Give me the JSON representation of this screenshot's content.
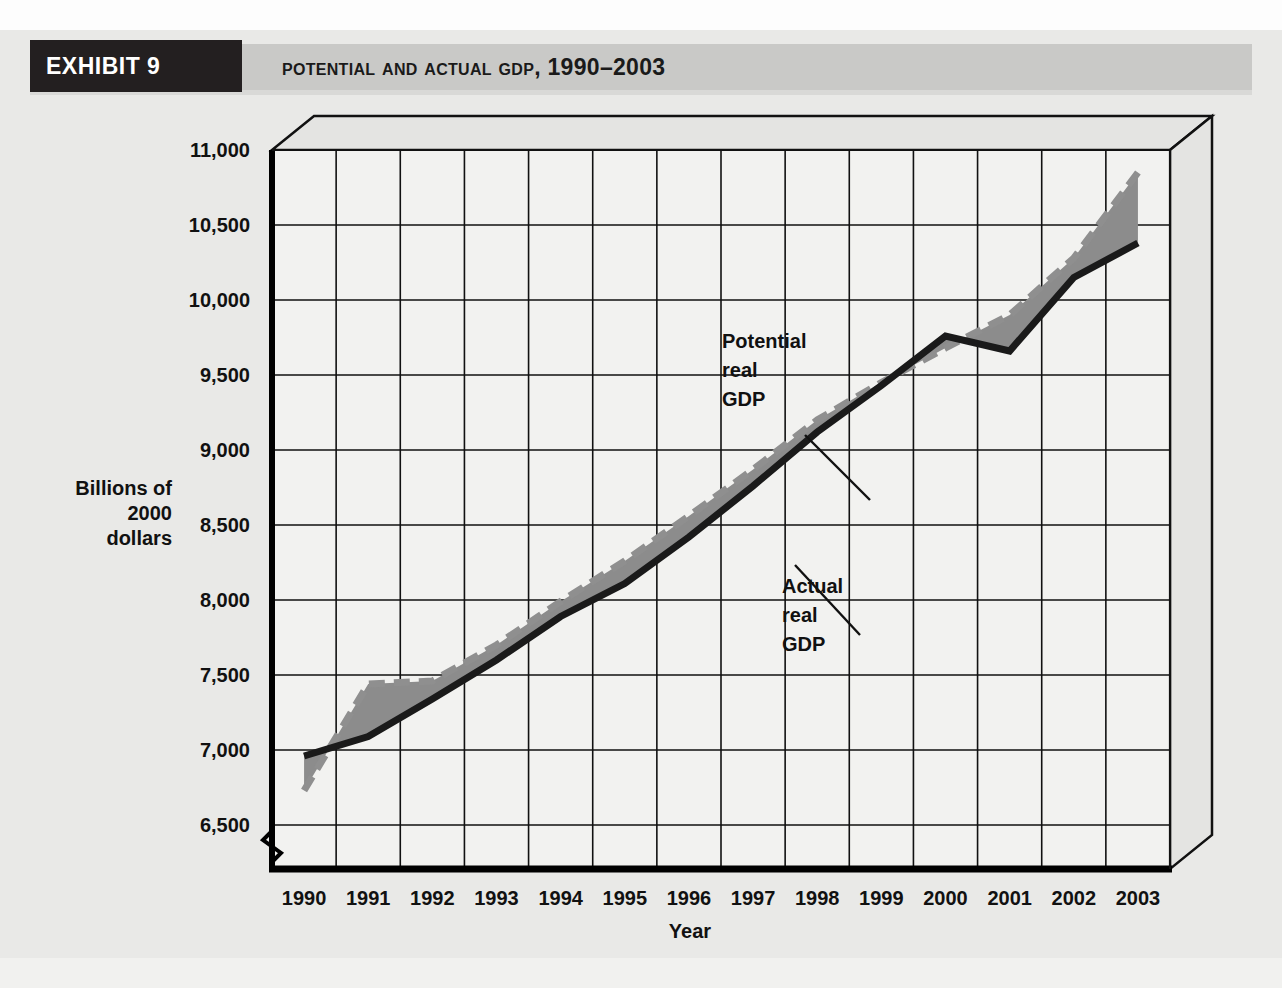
{
  "exhibit": {
    "tag": "EXHIBIT 9",
    "title": "Potential and Actual GDP, 1990–2003"
  },
  "colors": {
    "page_background": "#e9e9e7",
    "header_band": "#c9c9c7",
    "header_tag_background": "#231f20",
    "header_tag_text": "#ffffff",
    "plot_background": "#f2f2f0",
    "gap_fill": "#8c8c8c",
    "actual_line": "#1a1a1a",
    "potential_line": "#8f8f8f",
    "axis": "#000000"
  },
  "chart_data": {
    "type": "line",
    "title": "Potential and Actual GDP, 1990–2003",
    "xlabel": "Year",
    "ylabel": "Billions of 2000 dollars",
    "ylabel_lines": [
      "Billions of",
      "2000",
      "dollars"
    ],
    "categories": [
      1990,
      1991,
      1992,
      1993,
      1994,
      1995,
      1996,
      1997,
      1998,
      1999,
      2000,
      2001,
      2002,
      2003
    ],
    "tick_labels_x": [
      "1990",
      "1991",
      "1992",
      "1993",
      "1994",
      "1995",
      "1996",
      "1997",
      "1998",
      "1999",
      "2000",
      "2001",
      "2002",
      "2003"
    ],
    "tick_labels_y": [
      "6,500",
      "7,000",
      "7,500",
      "8,000",
      "8,500",
      "9,000",
      "9,500",
      "10,000",
      "10,500",
      "11,000"
    ],
    "ylim": [
      6500,
      11000
    ],
    "ytick_step": 500,
    "axis_break_y": true,
    "grid": true,
    "legend_position": "inline-annotations",
    "series": [
      {
        "name": "Potential real GDP",
        "style": "dashed",
        "color": "#8f8f8f",
        "values": [
          6730,
          7440,
          7460,
          7700,
          7990,
          8260,
          8560,
          8870,
          9200,
          9450,
          9680,
          9900,
          10280,
          10850
        ]
      },
      {
        "name": "Actual real GDP",
        "style": "solid",
        "color": "#1a1a1a",
        "values": [
          6960,
          7090,
          7340,
          7600,
          7890,
          8110,
          8420,
          8760,
          9120,
          9430,
          9760,
          9660,
          10150,
          10380
        ]
      }
    ],
    "annotations": [
      {
        "label_lines": [
          "Potential",
          "real",
          "GDP"
        ],
        "text": "Potential real GDP",
        "x": 1997.0,
        "y": 9950
      },
      {
        "label_lines": [
          "Actual",
          "real",
          "GDP"
        ],
        "text": "Actual real GDP",
        "x": 1998.1,
        "y": 8250
      }
    ]
  }
}
